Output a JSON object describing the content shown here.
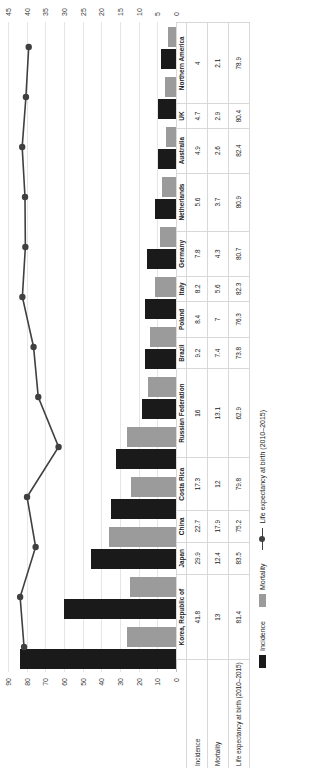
{
  "chart_data": {
    "type": "bar",
    "title": "",
    "xlabel": "",
    "ylabel": "",
    "grid": true,
    "legend_position": "bottom-left",
    "categories": [
      "Korea, Republic of",
      "Japan",
      "China",
      "Costa Rica",
      "Russian Federation",
      "Brazil",
      "Poland",
      "Italy",
      "Germany",
      "Netherlands",
      "Australia",
      "UK",
      "Northern America"
    ],
    "series": [
      {
        "name": "Incidence",
        "type": "bar",
        "color": "#1a1a1a",
        "axis": "secondary",
        "values": [
          41.8,
          29.9,
          22.7,
          17.3,
          16,
          9.2,
          8.4,
          8.2,
          7.8,
          5.6,
          4.9,
          4.7,
          4
        ]
      },
      {
        "name": "Mortality",
        "type": "bar",
        "color": "#9b9b9b",
        "axis": "secondary",
        "values": [
          13,
          12.4,
          17.9,
          12,
          13.1,
          7.4,
          7,
          5.6,
          4.3,
          3.7,
          2.6,
          2.9,
          2.1
        ]
      },
      {
        "name": "Life expectancy at birth (2010–2015)",
        "type": "line",
        "color": "#404040",
        "axis": "primary",
        "values": [
          81.4,
          83.5,
          75.2,
          79.8,
          62.9,
          73.8,
          76.3,
          82.3,
          80.7,
          80.9,
          82.4,
          80.4,
          78.9
        ]
      }
    ],
    "primary_axis": {
      "name": "life-expectancy-axis",
      "ticks": [
        0,
        10,
        20,
        30,
        40,
        50,
        60,
        70,
        80,
        90
      ],
      "ylim": [
        0,
        90
      ]
    },
    "secondary_axis": {
      "name": "rate-axis",
      "ticks": [
        0,
        5,
        10,
        15,
        20,
        25,
        30,
        35,
        40,
        45
      ],
      "ylim": [
        0,
        45
      ]
    },
    "table": {
      "row_headers": [
        "Incidence",
        "Mortality",
        "Life expectancy at birth (2010–2015)"
      ],
      "rows": [
        [
          "41.8",
          "29.9",
          "22.7",
          "17.3",
          "16",
          "9.2",
          "8.4",
          "8.2",
          "7.8",
          "5.6",
          "4.9",
          "4.7",
          "4"
        ],
        [
          "13",
          "12.4",
          "17.9",
          "12",
          "13.1",
          "7.4",
          "7",
          "5.6",
          "4.3",
          "3.7",
          "2.6",
          "2.9",
          "2.1"
        ],
        [
          "81.4",
          "83.5",
          "75.2",
          "79.8",
          "62.9",
          "73.8",
          "76.3",
          "82.3",
          "80.7",
          "80.9",
          "82.4",
          "80.4",
          "78.9"
        ]
      ]
    }
  },
  "legend": {
    "items": [
      {
        "label": "Incidence",
        "color": "#1a1a1a"
      },
      {
        "label": "Mortality",
        "color": "#9b9b9b"
      },
      {
        "label": "Life expectancy at birth (2010–2015)",
        "color": "#404040"
      }
    ]
  }
}
